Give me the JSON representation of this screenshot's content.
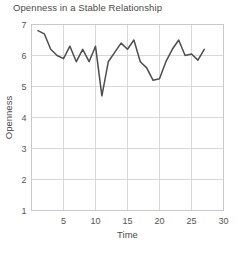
{
  "chart_data": {
    "type": "line",
    "title": "Openness in a Stable Relationship",
    "xlabel": "Time",
    "ylabel": "Openness",
    "xlim": [
      0,
      30
    ],
    "ylim": [
      1,
      7
    ],
    "grid": true,
    "legend": "none",
    "x_ticks": [
      5,
      10,
      15,
      20,
      25,
      30
    ],
    "y_ticks": [
      1,
      2,
      3,
      4,
      5,
      6,
      7
    ],
    "x": [
      1,
      2,
      3,
      4,
      5,
      6,
      7,
      8,
      9,
      10,
      11,
      12,
      13,
      14,
      15,
      16,
      17,
      18,
      19,
      20,
      21,
      22,
      23,
      24,
      25,
      26,
      27
    ],
    "series": [
      {
        "name": "Openness",
        "color": "#4d4d4d",
        "values": [
          6.8,
          6.7,
          6.2,
          6.0,
          5.9,
          6.3,
          5.8,
          6.2,
          5.8,
          6.3,
          4.7,
          5.8,
          6.1,
          6.4,
          6.2,
          6.5,
          5.8,
          5.6,
          5.2,
          5.25,
          5.8,
          6.2,
          6.5,
          6.0,
          6.05,
          5.85,
          6.2
        ]
      }
    ]
  }
}
